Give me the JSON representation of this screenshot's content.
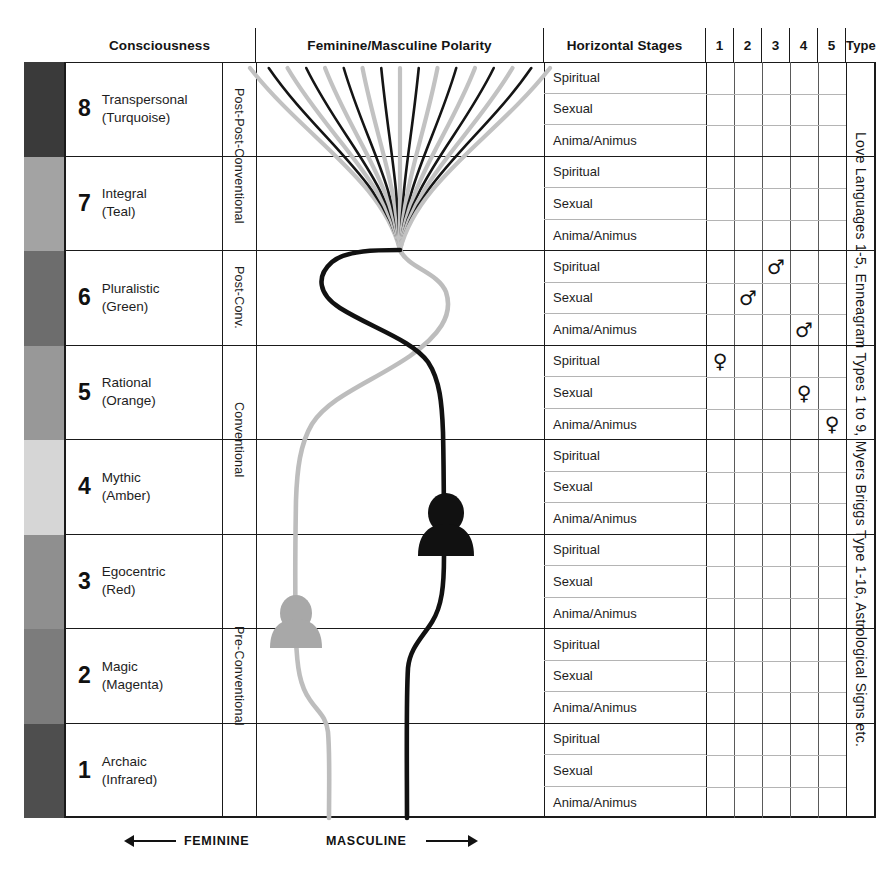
{
  "header": {
    "consciousness": "Consciousness",
    "polarity": "Feminine/Masculine Polarity",
    "stages": "Horizontal Stages",
    "type": "Type",
    "numbers": [
      "1",
      "2",
      "3",
      "4",
      "5"
    ]
  },
  "type_column": {
    "text": "Love Languages 1-5, Enneagram Types 1 to 9, Myers Briggs Type 1-16, Astrological Signs etc."
  },
  "footer": {
    "feminine": "FEMININE",
    "masculine": "MASCULINE"
  },
  "stage_names": [
    "Spiritual",
    "Sexual",
    "Anima/Animus"
  ],
  "tiers": [
    {
      "label": "Post-Post-Conventional",
      "levels": [
        8,
        7
      ]
    },
    {
      "label": "Post-Conv.",
      "levels": [
        6
      ]
    },
    {
      "label": "Conventional",
      "levels": [
        5,
        4
      ]
    },
    {
      "label": "Pre-Conventional",
      "levels": [
        3,
        2,
        1
      ]
    }
  ],
  "levels": [
    {
      "num": "8",
      "name": "Transpersonal",
      "color_name": "(Turquoise)",
      "swatch": "#3a3a3a"
    },
    {
      "num": "7",
      "name": "Integral",
      "color_name": "(Teal)",
      "swatch": "#a3a3a3"
    },
    {
      "num": "6",
      "name": "Pluralistic",
      "color_name": "(Green)",
      "swatch": "#6d6d6d"
    },
    {
      "num": "5",
      "name": "Rational",
      "color_name": "(Orange)",
      "swatch": "#989898"
    },
    {
      "num": "4",
      "name": "Mythic",
      "color_name": "(Amber)",
      "swatch": "#d6d6d6"
    },
    {
      "num": "3",
      "name": "Egocentric",
      "color_name": "(Red)",
      "swatch": "#8f8f8f"
    },
    {
      "num": "2",
      "name": "Magic",
      "color_name": "(Magenta)",
      "swatch": "#7c7c7c"
    },
    {
      "num": "1",
      "name": "Archaic",
      "color_name": "(Infrared)",
      "swatch": "#4e4e4e"
    }
  ],
  "markers": [
    {
      "level": 6,
      "stage": "Spiritual",
      "column": 3,
      "symbol": "♂",
      "kind": "masculine"
    },
    {
      "level": 6,
      "stage": "Sexual",
      "column": 2,
      "symbol": "♂",
      "kind": "masculine"
    },
    {
      "level": 6,
      "stage": "Anima/Animus",
      "column": 4,
      "symbol": "♂",
      "kind": "masculine"
    },
    {
      "level": 5,
      "stage": "Spiritual",
      "column": 1,
      "symbol": "♀",
      "kind": "feminine"
    },
    {
      "level": 5,
      "stage": "Sexual",
      "column": 4,
      "symbol": "♀",
      "kind": "feminine"
    },
    {
      "level": 5,
      "stage": "Anima/Animus",
      "column": 5,
      "symbol": "♀",
      "kind": "feminine"
    }
  ],
  "chart_data": {
    "type": "line",
    "title": "Feminine/Masculine Polarity",
    "xlabel": "Feminine ← | → Masculine",
    "ylabel": "Consciousness level",
    "series": [
      {
        "name": "Masculine",
        "color": "#111111"
      },
      {
        "name": "Feminine",
        "color": "#bdbdbd"
      }
    ],
    "fan_line_count": 17,
    "figures": [
      {
        "name": "masculine-figure",
        "level": 4,
        "color": "#111111"
      },
      {
        "name": "feminine-figure",
        "level": 3,
        "color": "#a8a8a8"
      }
    ]
  }
}
